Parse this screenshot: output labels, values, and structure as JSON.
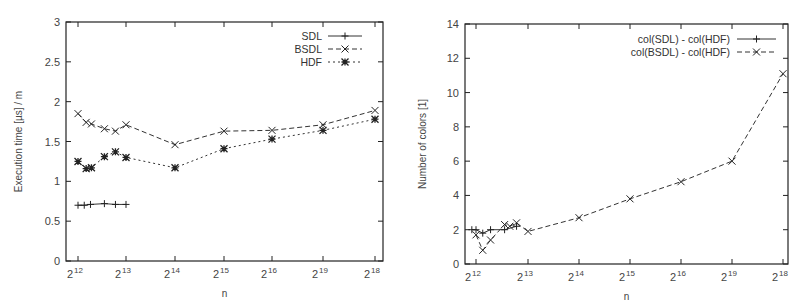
{
  "chart_data": [
    {
      "type": "line",
      "title": "",
      "xlabel": "n",
      "ylabel": "Execution time [µs] / m",
      "ylim": [
        0,
        3
      ],
      "yticks": [
        "0",
        "0.5",
        "1",
        "1.5",
        "2",
        "2.5",
        "3"
      ],
      "xticks": [
        {
          "base": "2",
          "exp": "12"
        },
        {
          "base": "2",
          "exp": "13"
        },
        {
          "base": "2",
          "exp": "14"
        },
        {
          "base": "2",
          "exp": "15"
        },
        {
          "base": "2",
          "exp": "16"
        },
        {
          "base": "2",
          "exp": "19"
        },
        {
          "base": "2",
          "exp": "18"
        }
      ],
      "grid": false,
      "legend_position": "top-right",
      "series": [
        {
          "name": "SDL",
          "marker": "plus",
          "line": "solid",
          "x": [
            12.0,
            12.13,
            12.26,
            12.55,
            12.78,
            13.0
          ],
          "values": [
            0.7,
            0.7,
            0.71,
            0.72,
            0.71,
            0.71
          ]
        },
        {
          "name": "BSDL",
          "marker": "cross",
          "line": "dashed",
          "x": [
            12.0,
            12.17,
            12.28,
            12.55,
            12.78,
            13.0,
            14.0,
            15.0,
            16.0,
            17.0,
            18.0
          ],
          "values": [
            1.85,
            1.74,
            1.72,
            1.66,
            1.63,
            1.71,
            1.46,
            1.63,
            1.64,
            1.71,
            1.89
          ]
        },
        {
          "name": "HDF",
          "marker": "star",
          "line": "dotted",
          "x": [
            12.0,
            12.17,
            12.28,
            12.55,
            12.78,
            13.0,
            14.0,
            15.0,
            16.0,
            17.0,
            18.0
          ],
          "values": [
            1.25,
            1.16,
            1.17,
            1.31,
            1.37,
            1.3,
            1.17,
            1.41,
            1.53,
            1.64,
            1.78
          ]
        }
      ]
    },
    {
      "type": "line",
      "title": "",
      "xlabel": "n",
      "ylabel": "Number of colors [1]",
      "ylim": [
        0,
        14
      ],
      "yticks": [
        "0",
        "2",
        "4",
        "6",
        "8",
        "10",
        "12",
        "14"
      ],
      "xticks": [
        {
          "base": "2",
          "exp": "12"
        },
        {
          "base": "2",
          "exp": "13"
        },
        {
          "base": "2",
          "exp": "14"
        },
        {
          "base": "2",
          "exp": "15"
        },
        {
          "base": "2",
          "exp": "16"
        },
        {
          "base": "2",
          "exp": "19"
        },
        {
          "base": "2",
          "exp": "18"
        }
      ],
      "grid": false,
      "legend_position": "top-right",
      "series": [
        {
          "name": "col(SDL) - col(HDF)",
          "marker": "plus",
          "line": "solid",
          "x": [
            11.92,
            12.0,
            12.13,
            12.28,
            12.55,
            12.78
          ],
          "values": [
            2.0,
            2.0,
            1.8,
            2.0,
            2.0,
            2.2
          ]
        },
        {
          "name": "col(BSDL) - col(HDF)",
          "marker": "cross",
          "line": "dashed",
          "x": [
            12.0,
            12.13,
            12.28,
            12.55,
            12.65,
            12.78,
            13.0,
            14.0,
            15.0,
            16.0,
            17.0,
            18.0
          ],
          "values": [
            1.7,
            0.8,
            1.4,
            2.3,
            2.2,
            2.4,
            1.9,
            2.7,
            3.8,
            4.8,
            6.0,
            11.1
          ]
        }
      ]
    }
  ]
}
